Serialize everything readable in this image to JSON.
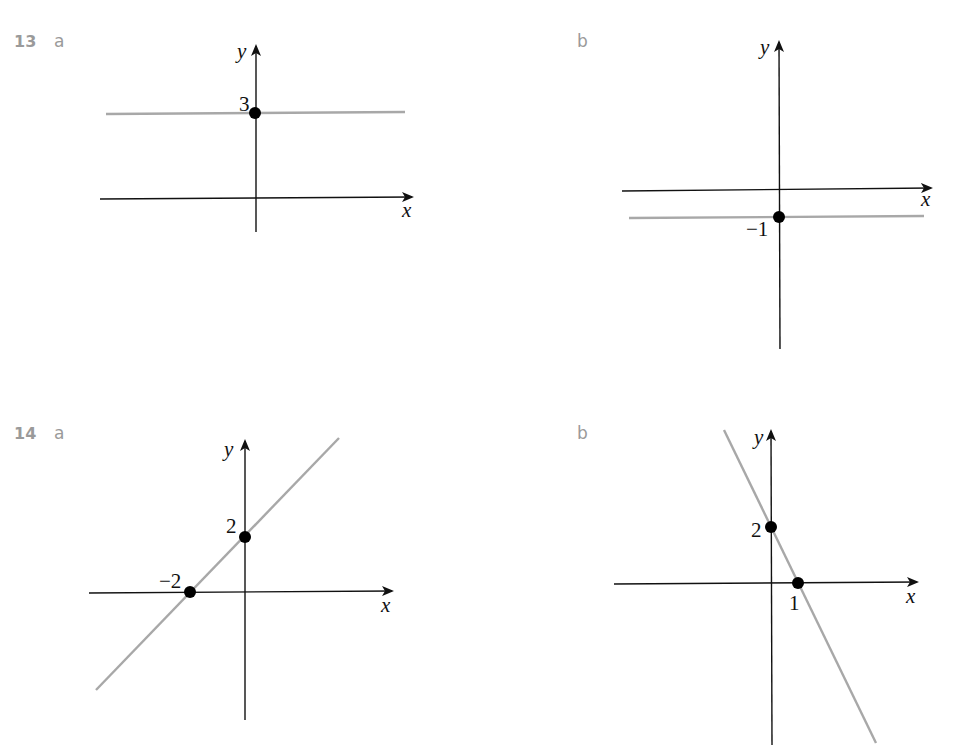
{
  "questions": [
    {
      "number": "13",
      "parts": [
        {
          "label": "a",
          "axis_labels": {
            "x": "x",
            "y": "y"
          },
          "points": [
            {
              "label": "3",
              "x": 0,
              "y": 3
            }
          ],
          "line": "horizontal y = 3"
        },
        {
          "label": "b",
          "axis_labels": {
            "x": "x",
            "y": "y"
          },
          "points": [
            {
              "label": "−1",
              "x": 0,
              "y": -1
            }
          ],
          "line": "horizontal y = -1"
        }
      ]
    },
    {
      "number": "14",
      "parts": [
        {
          "label": "a",
          "axis_labels": {
            "x": "x",
            "y": "y"
          },
          "points": [
            {
              "label": "2",
              "x": 0,
              "y": 2
            },
            {
              "label": "−2",
              "x": -2,
              "y": 0
            }
          ],
          "line": "y = x + 2"
        },
        {
          "label": "b",
          "axis_labels": {
            "x": "x",
            "y": "y"
          },
          "points": [
            {
              "label": "2",
              "x": 0,
              "y": 2
            },
            {
              "label": "1",
              "x": 1,
              "y": 0
            }
          ],
          "line": "y = -2x + 2"
        }
      ]
    }
  ],
  "colors": {
    "label_gray": "#9a9a9a",
    "line_gray": "#a8a8a8",
    "axis": "#111111",
    "point": "#000000"
  }
}
